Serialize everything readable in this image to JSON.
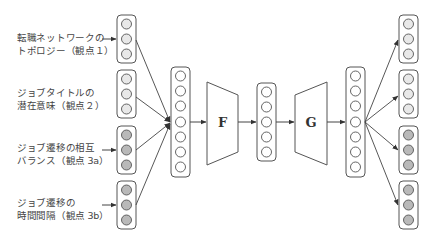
{
  "colors": {
    "stroke": "#555555",
    "node_fill_light": "#e8e8e8",
    "node_fill_dark": "#b9b9b9",
    "background": "#ffffff",
    "text": "#444444"
  },
  "inputs": [
    {
      "line1": "転職ネットワークの",
      "line2": "トポロジー（観点１）",
      "node_count": 3,
      "fill": "light"
    },
    {
      "line1": "ジョブタイトルの",
      "line2": "潜在意味（観点２）",
      "node_count": 3,
      "fill": "light"
    },
    {
      "line1": "ジョブ遷移の相互",
      "line2": "バランス（観点 3a）",
      "node_count": 3,
      "fill": "dark"
    },
    {
      "line1": "ジョブ遷移の",
      "line2": "時間間隔（観点 3b）",
      "node_count": 3,
      "fill": "dark"
    }
  ],
  "concat_layer": {
    "node_count": 7
  },
  "encoder": {
    "label": "F"
  },
  "latent_layer": {
    "node_count": 5
  },
  "decoder": {
    "label": "G"
  },
  "reconstruction_layer": {
    "node_count": 7
  },
  "outputs": [
    {
      "node_count": 3,
      "fill": "light"
    },
    {
      "node_count": 3,
      "fill": "light"
    },
    {
      "node_count": 3,
      "fill": "dark"
    },
    {
      "node_count": 3,
      "fill": "dark"
    }
  ]
}
